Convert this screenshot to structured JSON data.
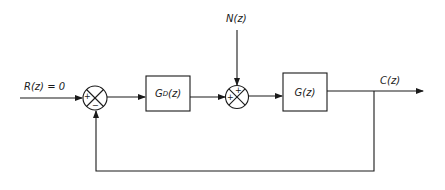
{
  "diagram": {
    "type": "closed-loop block diagram",
    "input_label": "R(z) = 0",
    "disturbance_label": "N(z)",
    "output_label": "C(z)",
    "summing_junction_1": {
      "signs": {
        "left": "+",
        "bottom": "−"
      }
    },
    "summing_junction_2": {
      "signs": {
        "top": "+",
        "left": "+"
      }
    },
    "blocks": [
      {
        "id": "controller",
        "main": "G",
        "sub": "D",
        "arg": "(z)"
      },
      {
        "id": "plant",
        "main": "G",
        "sub": "",
        "arg": "(z)"
      }
    ],
    "feedback": "unity negative feedback from C(z) to first summing junction",
    "colors": {
      "line": "#1a1a1a",
      "background": "#ffffff"
    }
  }
}
